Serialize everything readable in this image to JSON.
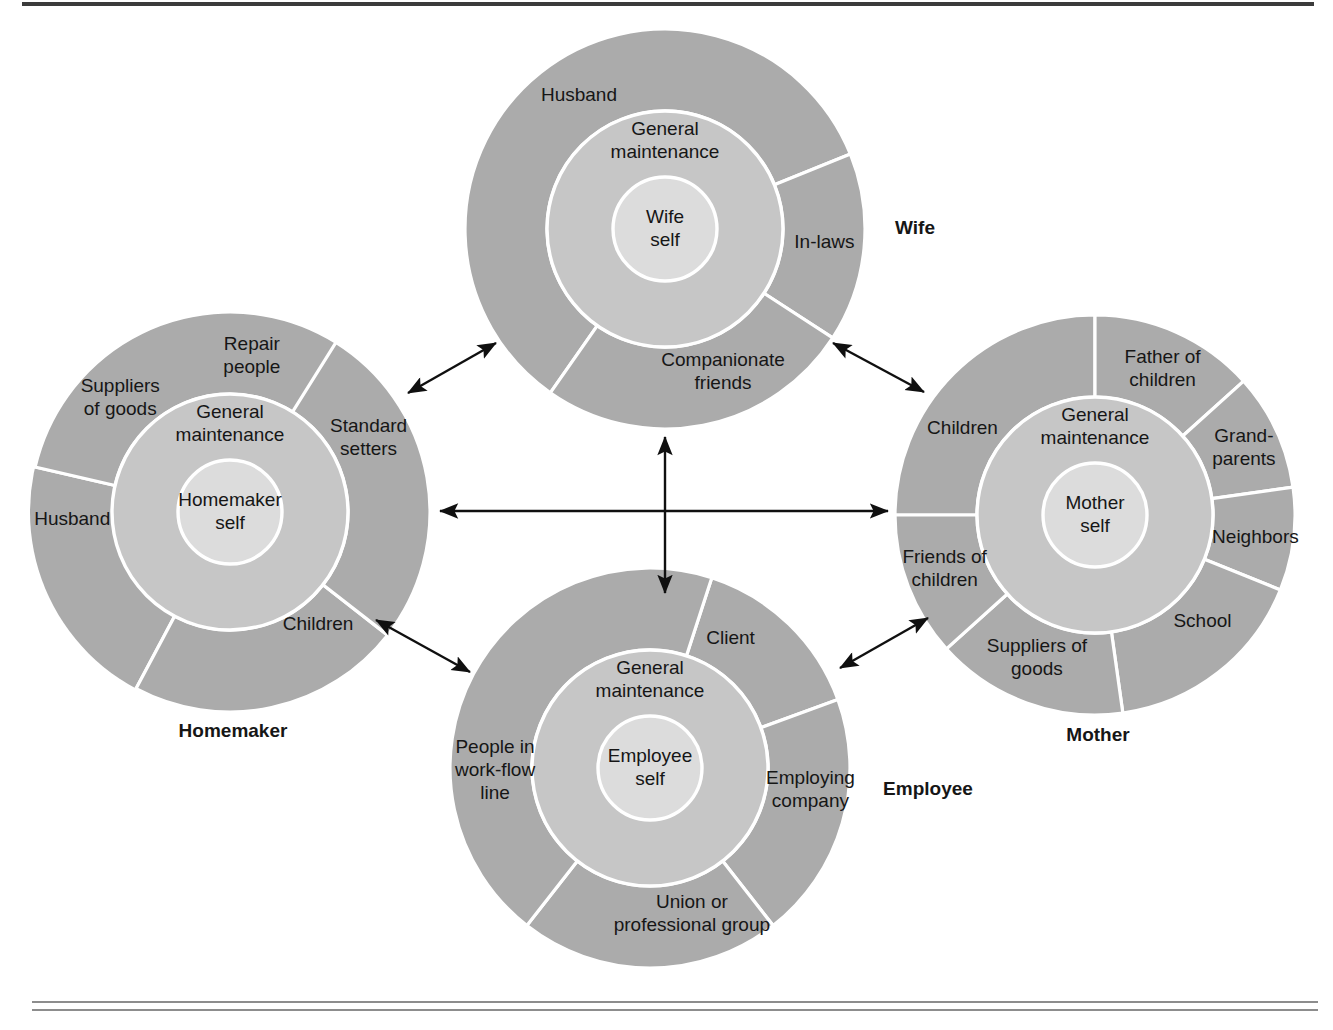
{
  "figure": {
    "colors": {
      "outer_ring": "#ababab",
      "middle_ring": "#c6c6c6",
      "inner_core": "#dcdcdc",
      "divider": "#ffffff",
      "text": "#161616",
      "arrow": "#101010",
      "rule": "#8d8d8d"
    },
    "geometry": {
      "outer_radius": 200,
      "middle_radius": 118,
      "inner_radius": 52
    }
  },
  "common": {
    "middle_ring_label_line1": "General",
    "middle_ring_label_line2": "maintenance"
  },
  "circles": [
    {
      "id": "wife",
      "role_label": "Wife",
      "role_label_x": 915,
      "role_label_y": 229,
      "center_x": 665,
      "center_y": 229,
      "core_line1": "Wife",
      "core_line2": "self",
      "middle_line1": "General",
      "middle_line2": "maintenance",
      "middle_label_angle": -90,
      "sectors": [
        {
          "label_line1": "Husband",
          "label_line2": "",
          "start_angle": 125,
          "end_angle": 338,
          "label_angle": -123,
          "label_radius": 158
        },
        {
          "label_line1": "In-laws",
          "label_line2": "",
          "start_angle": 338,
          "end_angle": 33,
          "label_angle": 5,
          "label_radius": 160
        },
        {
          "label_line1": "Companionate",
          "label_line2": "friends",
          "start_angle": 33,
          "end_angle": 125,
          "label_angle": 68,
          "label_radius": 155
        }
      ]
    },
    {
      "id": "homemaker",
      "role_label": "Homemaker",
      "role_label_x": 233,
      "role_label_y": 732,
      "center_x": 230,
      "center_y": 512,
      "core_line1": "Homemaker",
      "core_line2": "self",
      "middle_line1": "General",
      "middle_line2": "maintenance",
      "middle_label_angle": -90,
      "sectors": [
        {
          "label_line1": "Repair",
          "label_line2": "people",
          "start_angle": 256,
          "end_angle": 302,
          "label_angle": -82,
          "label_radius": 157
        },
        {
          "label_line1": "Suppliers",
          "label_line2": "of goods",
          "start_angle": 193,
          "end_angle": 256,
          "label_angle": -134,
          "label_radius": 158
        },
        {
          "label_line1": "Husband",
          "label_line2": "",
          "start_angle": 193,
          "end_angle": 118,
          "label_angle": 177,
          "label_radius": 158
        },
        {
          "label_line1": "Children",
          "label_line2": "",
          "start_angle": 38,
          "end_angle": 118,
          "label_angle": 52,
          "label_radius": 143
        },
        {
          "label_line1": "Standard",
          "label_line2": "setters",
          "start_angle": 302,
          "end_angle": 38,
          "label_angle": -28,
          "label_radius": 157
        }
      ]
    },
    {
      "id": "mother",
      "role_label": "Mother",
      "role_label_x": 1098,
      "role_label_y": 736,
      "center_x": 1095,
      "center_y": 515,
      "core_line1": "Mother",
      "core_line2": "self",
      "middle_line1": "General",
      "middle_line2": "maintenance",
      "middle_label_angle": -90,
      "sectors": [
        {
          "label_line1": "Children",
          "label_line2": "",
          "start_angle": 180,
          "end_angle": 270,
          "label_angle": -147,
          "label_radius": 158
        },
        {
          "label_line1": "Father of",
          "label_line2": "children",
          "start_angle": 270,
          "end_angle": 318,
          "label_angle": -65,
          "label_radius": 160
        },
        {
          "label_line1": "Grand-",
          "label_line2": "parents",
          "start_angle": 318,
          "end_angle": 352,
          "label_angle": -24,
          "label_radius": 163
        },
        {
          "label_line1": "Neighbors",
          "label_line2": "",
          "start_angle": 352,
          "end_angle": 22,
          "label_angle": 8,
          "label_radius": 162
        },
        {
          "label_line1": "School",
          "label_line2": "",
          "start_angle": 22,
          "end_angle": 82,
          "label_angle": 45,
          "label_radius": 152
        },
        {
          "label_line1": "Suppliers of",
          "label_line2": "goods",
          "start_angle": 82,
          "end_angle": 138,
          "label_angle": 112,
          "label_radius": 155
        },
        {
          "label_line1": "Friends of",
          "label_line2": "children",
          "start_angle": 138,
          "end_angle": 180,
          "label_angle": 160,
          "label_radius": 160
        }
      ]
    },
    {
      "id": "employee",
      "role_label": "Employee",
      "role_label_x": 928,
      "role_label_y": 790,
      "center_x": 650,
      "center_y": 768,
      "core_line1": "Employee",
      "core_line2": "self",
      "middle_line1": "General",
      "middle_line2": "maintenance",
      "middle_label_angle": -90,
      "sectors": [
        {
          "label_line1": "Client",
          "label_line2": "",
          "start_angle": 288,
          "end_angle": 340,
          "label_angle": -58,
          "label_radius": 152
        },
        {
          "label_line1": "Employing",
          "label_line2": "company",
          "start_angle": 340,
          "end_angle": 52,
          "label_angle": 8,
          "label_radius": 162
        },
        {
          "label_line1": "Union or",
          "label_line2": "professional group",
          "start_angle": 52,
          "end_angle": 128,
          "label_angle": 74,
          "label_radius": 152
        },
        {
          "label_line1": "People in",
          "label_line2": "work-flow",
          "label_line3": "line",
          "start_angle": 128,
          "end_angle": 288,
          "label_angle": 179,
          "label_radius": 155
        }
      ]
    }
  ],
  "arrows": [
    {
      "id": "homemaker-wife",
      "x1": 408,
      "y1": 393,
      "x2": 496,
      "y2": 343
    },
    {
      "id": "wife-mother",
      "x1": 833,
      "y1": 343,
      "x2": 924,
      "y2": 392
    },
    {
      "id": "homemaker-employee",
      "x1": 376,
      "y1": 620,
      "x2": 470,
      "y2": 672
    },
    {
      "id": "employee-mother",
      "x1": 840,
      "y1": 668,
      "x2": 928,
      "y2": 618
    },
    {
      "id": "wife-employee-vertical",
      "x1": 665,
      "y1": 437,
      "x2": 665,
      "y2": 593
    },
    {
      "id": "homemaker-mother-horizontal",
      "x1": 440,
      "y1": 511,
      "x2": 888,
      "y2": 511
    }
  ]
}
